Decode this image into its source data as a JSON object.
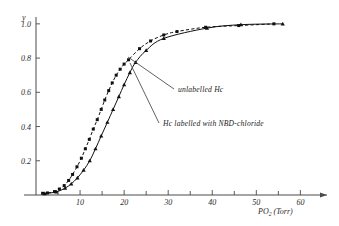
{
  "chart_data": {
    "type": "line",
    "title": "",
    "subtitle": "",
    "xlabel": "PO2 (Torr)",
    "xlabel_base": "PO",
    "xlabel_sub": "2",
    "xlabel_unit": "(Torr)",
    "ylabel": "y",
    "xlim": [
      0,
      64
    ],
    "ylim": [
      0,
      1.04
    ],
    "grid": false,
    "legend_position": "inline-annotations",
    "x_ticks_major": [
      10,
      20,
      30,
      40,
      50,
      60
    ],
    "x_ticks_minor": [
      5,
      15,
      25,
      35,
      45,
      55
    ],
    "x_tick_labels": [
      "10",
      "20",
      "30",
      "40",
      "50",
      "60"
    ],
    "y_ticks": [
      0.2,
      0.4,
      0.6,
      0.8,
      1.0
    ],
    "y_tick_labels": [
      "0.2",
      "0.4",
      "0.6",
      "0.8",
      "1.0"
    ],
    "series": [
      {
        "name": "unlabelled Hc",
        "marker": "square",
        "line_style": "dashed",
        "color": "#111111",
        "points": [
          {
            "x": 1.5,
            "y": 0.01
          },
          {
            "x": 2.6,
            "y": 0.012
          },
          {
            "x": 4.2,
            "y": 0.02
          },
          {
            "x": 5.3,
            "y": 0.035
          },
          {
            "x": 6.4,
            "y": 0.055
          },
          {
            "x": 7.4,
            "y": 0.085
          },
          {
            "x": 8.3,
            "y": 0.12
          },
          {
            "x": 9.3,
            "y": 0.165
          },
          {
            "x": 10.3,
            "y": 0.215
          },
          {
            "x": 11.2,
            "y": 0.27
          },
          {
            "x": 12.1,
            "y": 0.325
          },
          {
            "x": 13.0,
            "y": 0.385
          },
          {
            "x": 13.9,
            "y": 0.44
          },
          {
            "x": 14.8,
            "y": 0.5
          },
          {
            "x": 15.6,
            "y": 0.555
          },
          {
            "x": 16.5,
            "y": 0.61
          },
          {
            "x": 17.3,
            "y": 0.655
          },
          {
            "x": 18.2,
            "y": 0.7
          },
          {
            "x": 19.1,
            "y": 0.735
          },
          {
            "x": 20.0,
            "y": 0.765
          },
          {
            "x": 21.0,
            "y": 0.79
          },
          {
            "x": 23.5,
            "y": 0.855
          },
          {
            "x": 26.0,
            "y": 0.9
          },
          {
            "x": 29.0,
            "y": 0.935
          },
          {
            "x": 32.0,
            "y": 0.955
          },
          {
            "x": 38.5,
            "y": 0.98
          },
          {
            "x": 46.0,
            "y": 0.99
          },
          {
            "x": 54.0,
            "y": 1.0
          }
        ]
      },
      {
        "name": "Hc labelled with NBD-chloride",
        "marker": "triangle",
        "line_style": "solid",
        "color": "#111111",
        "points": [
          {
            "x": 2.0,
            "y": 0.008
          },
          {
            "x": 4.6,
            "y": 0.018
          },
          {
            "x": 6.6,
            "y": 0.04
          },
          {
            "x": 8.0,
            "y": 0.065
          },
          {
            "x": 9.4,
            "y": 0.1
          },
          {
            "x": 10.8,
            "y": 0.145
          },
          {
            "x": 12.2,
            "y": 0.2
          },
          {
            "x": 13.5,
            "y": 0.27
          },
          {
            "x": 14.8,
            "y": 0.345
          },
          {
            "x": 16.2,
            "y": 0.425
          },
          {
            "x": 17.5,
            "y": 0.5
          },
          {
            "x": 18.8,
            "y": 0.575
          },
          {
            "x": 20.0,
            "y": 0.645
          },
          {
            "x": 21.3,
            "y": 0.715
          },
          {
            "x": 22.6,
            "y": 0.775
          },
          {
            "x": 25.0,
            "y": 0.845
          },
          {
            "x": 29.0,
            "y": 0.915
          },
          {
            "x": 38.8,
            "y": 0.975
          },
          {
            "x": 46.5,
            "y": 0.995
          },
          {
            "x": 56.0,
            "y": 1.0
          }
        ]
      }
    ],
    "annotations": [
      {
        "id": "unlabelled",
        "text": "unlabelled Hc",
        "text_x": 178,
        "text_y": 92,
        "leader_from_x": 128,
        "leader_from_y": 57,
        "leader_to_x": 174,
        "leader_to_y": 89
      },
      {
        "id": "labelled",
        "text": "Hc labelled with NBD-chloride",
        "text_x": 163,
        "text_y": 126,
        "leader_from_x": 130,
        "leader_from_y": 63,
        "leader_to_x": 159,
        "leader_to_y": 123
      }
    ]
  }
}
